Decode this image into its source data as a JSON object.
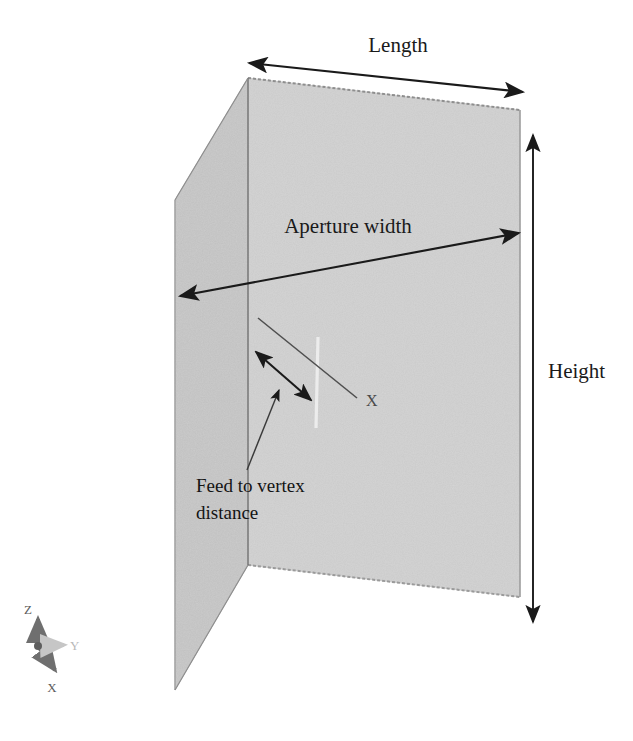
{
  "figure": {
    "background_color": "#ffffff",
    "panel_fill_color": "#a8a8a8",
    "panel_edge_color": "#6e6e6e",
    "annotation_color": "#1a1a1a",
    "feed_line_color": "#e8e8e8"
  },
  "dimensions": {
    "length": {
      "label": "Length",
      "label_x": 398,
      "label_y": 52,
      "arrow_start": {
        "x": 249,
        "y": 63
      },
      "arrow_end": {
        "x": 523,
        "y": 92
      }
    },
    "aperture_width": {
      "label": "Aperture width",
      "label_x": 348,
      "label_y": 233,
      "arrow_start": {
        "x": 180,
        "y": 296
      },
      "arrow_end": {
        "x": 519,
        "y": 233
      }
    },
    "height": {
      "label": "Height",
      "label_x": 548,
      "label_y": 378,
      "arrow_start": {
        "x": 533,
        "y": 135
      },
      "arrow_end": {
        "x": 533,
        "y": 622
      }
    }
  },
  "callouts": {
    "feed_to_vertex": {
      "line1": "Feed to vertex",
      "line2": "distance",
      "line1_x": 196,
      "line1_y": 492,
      "line2_x": 196,
      "line2_y": 519,
      "leader_start": {
        "x": 247,
        "y": 470
      },
      "leader_end": {
        "x": 277,
        "y": 386
      },
      "measure_start": {
        "x": 256,
        "y": 352
      },
      "measure_end": {
        "x": 311,
        "y": 400
      }
    },
    "x_axis_ray": {
      "label": "X",
      "label_x": 366,
      "label_y": 406,
      "ray_start": {
        "x": 258,
        "y": 318
      },
      "ray_end": {
        "x": 357,
        "y": 398
      }
    }
  },
  "feed_element": {
    "name": "feed-dipole",
    "top": {
      "x": 318,
      "y": 337
    },
    "bottom": {
      "x": 316,
      "y": 428
    }
  },
  "reflector": {
    "left_panel": {
      "name": "left-reflector-panel",
      "points": "175,200 248,78 248,565 175,690"
    },
    "right_panel": {
      "name": "right-reflector-panel",
      "points": "248,78 520,110 520,597 248,565"
    },
    "vertex_edge": {
      "top": {
        "x": 248,
        "y": 78
      },
      "bottom": {
        "x": 248,
        "y": 565
      }
    }
  },
  "axis_triad": {
    "origin": {
      "x": 38,
      "y": 633
    },
    "z": {
      "label": "Z",
      "label_x": 28,
      "label_y": 614,
      "tip_x": 38,
      "tip_y": 617
    },
    "y": {
      "label": "Y",
      "label_x": 70,
      "label_y": 650,
      "tip_x": 64,
      "tip_y": 645
    },
    "x": {
      "label": "X",
      "label_x": 52,
      "label_y": 692,
      "tip_x": 54,
      "tip_y": 669
    }
  }
}
